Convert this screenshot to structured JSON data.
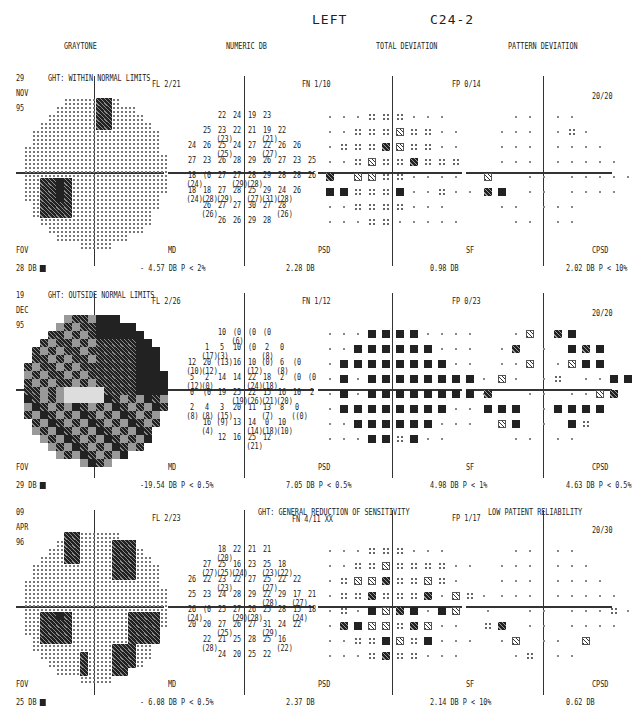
{
  "header": {
    "eye": "LEFT",
    "program": "C24-2"
  },
  "columns": [
    "GRAYTONE",
    "NUMERIC DB",
    "TOTAL DEVIATION",
    "PATTERN DEVIATION"
  ],
  "tests": [
    {
      "day": "29",
      "month": "NOV",
      "year": "95",
      "ght": "GHT: WITHIN NORMAL LIMITS",
      "fl": "FL  2/21",
      "fn": "FN  1/10",
      "fp": "FP  0/14",
      "pattern_label": "20/20",
      "fov_label": "FOV",
      "fov_value": "28 DB",
      "md_label": "MD",
      "md_value": "- 4.57 DB   P <  2%",
      "psd_label": "PSD",
      "psd_value": "2.28 DB",
      "sf_label": "SF",
      "sf_value": "0.98 DB",
      "cpsd_label": "CPSD",
      "cpsd_value": "2.02 DB   P <  10%",
      "reliability": ""
    },
    {
      "day": "19",
      "month": "DEC",
      "year": "95",
      "ght": "GHT: OUTSIDE NORMAL LIMITS",
      "fl": "FL  2/26",
      "fn": "FN  1/12",
      "fp": "FP  0/23",
      "pattern_label": "20/20",
      "fov_label": "FOV",
      "fov_value": "29 DB",
      "md_label": "MD",
      "md_value": "-19.54 DB   P < 0.5%",
      "psd_label": "PSD",
      "psd_value": "7.05 DB   P < 0.5%",
      "sf_label": "SF",
      "sf_value": "4.98 DB   P <  1%",
      "cpsd_label": "CPSD",
      "cpsd_value": "4.63 DB   P < 0.5%",
      "reliability": ""
    },
    {
      "day": "09",
      "month": "APR",
      "year": "96",
      "ght": "GHT: GENERAL REDUCTION OF SENSITIVITY",
      "fl": "FL  2/23",
      "fn": "FN  4/11 XX",
      "fp": "FP  1/17",
      "pattern_label": "20/30",
      "fov_label": "FOV",
      "fov_value": "25 DB",
      "md_label": "MD",
      "md_value": "- 6.08 DB   P < 0.5%",
      "psd_label": "PSD",
      "psd_value": "2.37 DB",
      "sf_label": "SF",
      "sf_value": "2.14 DB   P <  10%",
      "cpsd_label": "CPSD",
      "cpsd_value": "0.62 DB",
      "reliability": "LOW PATIENT RELIABILITY"
    }
  ],
  "numeric": [
    {
      "rows": [
        [
          "",
          "",
          "",
          "22",
          "24",
          "19",
          "23",
          "",
          "",
          ""
        ],
        [
          "",
          "",
          "25",
          "23\n(23)",
          "22",
          "21",
          "19\n(21)",
          "22",
          "",
          ""
        ],
        [
          "",
          "24",
          "26",
          "25\n(25)",
          "24",
          "27",
          "22\n(27)",
          "26",
          "26",
          ""
        ],
        [
          "",
          "27",
          "23",
          "26",
          "28",
          "29",
          "26",
          "27",
          "23",
          "25"
        ],
        [
          "",
          "18\n(24)",
          "(0",
          "27",
          "27\n(29)",
          "28\n(28)",
          "29",
          "28",
          "28",
          "26"
        ],
        [
          "",
          "18\n(24)",
          "18\n(28)",
          "27\n(29)",
          "28",
          "25\n(27)",
          "29\n(31)",
          "24\n(28)",
          "26",
          ""
        ],
        [
          "",
          "",
          "26\n(26)",
          "27",
          "27",
          "30",
          "27",
          "28\n(26)",
          "",
          ""
        ],
        [
          "",
          "",
          "",
          "26",
          "26",
          "29",
          "28",
          "",
          "",
          ""
        ]
      ]
    },
    {
      "rows": [
        [
          "",
          "",
          "",
          "10",
          "(0\n(6)",
          "(0",
          "(0",
          "",
          "",
          ""
        ],
        [
          "",
          "",
          "1\n(17)",
          "5\n(3)",
          "10",
          "(0",
          "2\n(8)",
          "0",
          "",
          ""
        ],
        [
          "",
          "12\n(10)",
          "20\n(12)",
          "(13)",
          "16",
          "10\n(12)",
          "(0)",
          "6\n(8)",
          "(0",
          ""
        ],
        [
          "",
          "5\n(12)",
          "2\n(0)",
          "14",
          "14",
          "22\n(24)",
          "18\n(18)",
          "2",
          "(0",
          "(0"
        ],
        [
          "",
          "0",
          "(0",
          "19",
          "25\n(19)",
          "22\n(26)",
          "15\n(21)",
          "16\n(20)",
          "10",
          "2"
        ],
        [
          "",
          "2\n(8)",
          "4\n(8)",
          "3\n(15)",
          "20",
          "11",
          "13\n(7)",
          "8",
          "0\n((0)",
          ""
        ],
        [
          "",
          "",
          "16\n(4)",
          "(9)",
          "13",
          "14\n(14)",
          "0\n(18)",
          "10\n(10)",
          "",
          ""
        ],
        [
          "",
          "",
          "",
          "12",
          "16",
          "25\n(21)",
          "12",
          "",
          "",
          ""
        ]
      ]
    },
    {
      "rows": [
        [
          "",
          "",
          "",
          "18\n(20)",
          "22",
          "21",
          "21",
          "",
          "",
          ""
        ],
        [
          "",
          "",
          "27\n(27)",
          "25\n(25)",
          "16\n(24)",
          "23",
          "25\n(23)",
          "18\n(22)",
          "",
          ""
        ],
        [
          "",
          "26",
          "22",
          "23\n(23)",
          "22",
          "27",
          "25\n(27)",
          "22",
          "22",
          ""
        ],
        [
          "",
          "25",
          "23",
          "24",
          "28",
          "29",
          "22\n(28)",
          "29",
          "17\n(27)",
          "21"
        ],
        [
          "",
          "26\n(24)",
          "(0",
          "25",
          "27\n(29)",
          "26\n(28)",
          "25",
          "28",
          "15\n(24)",
          "18"
        ],
        [
          "",
          "20",
          "20",
          "27\n(25)",
          "26",
          "27",
          "31\n(29)",
          "24",
          "22",
          ""
        ],
        [
          "",
          "",
          "22\n(28)",
          "21",
          "25",
          "28",
          "25",
          "16\n(22)",
          "",
          ""
        ],
        [
          "",
          "",
          "",
          "24",
          "20",
          "25",
          "22",
          "",
          "",
          ""
        ]
      ]
    }
  ],
  "total_deviation": [
    [
      "000s1s000",
      "00s1121100",
      "01s1321100",
      "001211311s",
      "3 221s0000",
      "44s11400s00",
      "00s11s000",
      "000ss00000"
    ],
    [
      "00044440000",
      "00444444000",
      "04444444400",
      "040444444440",
      "040444444440",
      "04444444400",
      "00444444000",
      "000441400"
    ],
    [
      "000s1s000",
      "00ss2111100",
      "0s22311210",
      "01s311130210",
      "0104234042",
      "03422s3200",
      "00s142s4000",
      "000s31s000"
    ]
  ],
  "pattern_deviation": [
    [
      "0",
      "0",
      "0",
      "0"
    ],
    [
      "0",
      "0",
      "0",
      "0"
    ],
    [
      "0",
      "0",
      "0",
      "0"
    ]
  ],
  "symbol_legend": {
    "s0": "dot (normal)",
    "s1": "p<5%",
    "s2": "p<2%",
    "s3": "p<1%",
    "s4": "p<0.5%"
  }
}
